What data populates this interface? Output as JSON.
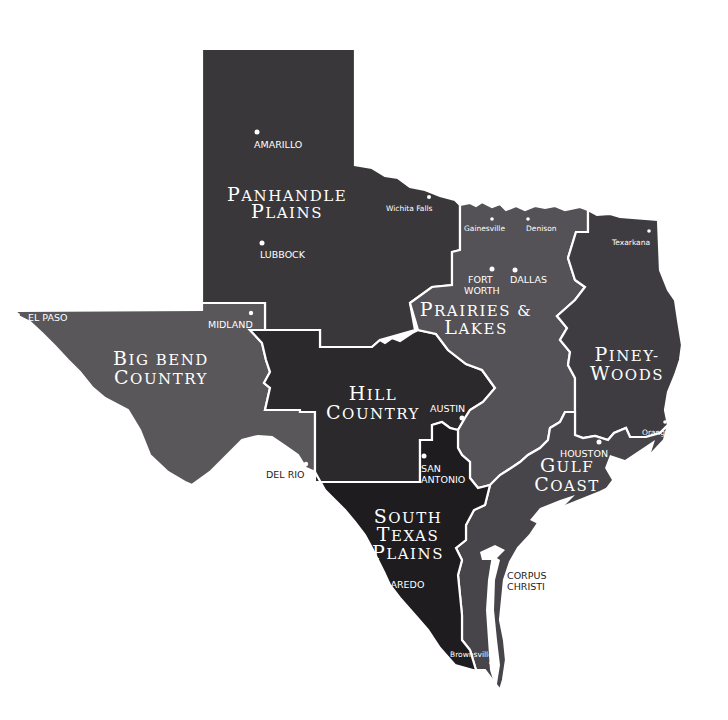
{
  "map": {
    "title": "Texas Regions",
    "colors": {
      "panhandle_plains": "#39373a",
      "big_bend_country": "#59575a",
      "hill_country": "#2b292c",
      "prairies_lakes": "#545256",
      "piney_woods": "#3e3c40",
      "gulf_coast": "#47454a",
      "south_texas_plains": "#1e1c1f",
      "border": "#ffffff",
      "background": "#ffffff"
    },
    "regions": [
      {
        "id": "panhandle_plains",
        "line1": "Panhandle",
        "line2": "Plains"
      },
      {
        "id": "big_bend_country",
        "line1": "Big Bend",
        "line2": "Country"
      },
      {
        "id": "hill_country",
        "line1": "Hill",
        "line2": "Country"
      },
      {
        "id": "prairies_lakes",
        "line1": "Prairies &",
        "line2": "Lakes"
      },
      {
        "id": "piney_woods",
        "line1": "Piney-",
        "line2": "woods"
      },
      {
        "id": "gulf_coast",
        "line1": "Gulf",
        "line2": "Coast"
      },
      {
        "id": "south_texas_plains",
        "line1": "South",
        "line2": "Texas",
        "line3": "Plains"
      }
    ],
    "cities": [
      {
        "name": "AMARILLO"
      },
      {
        "name": "LUBBOCK"
      },
      {
        "name": "Wichita Falls"
      },
      {
        "name": "Gainesville"
      },
      {
        "name": "Denison"
      },
      {
        "name": "Texarkana"
      },
      {
        "name": "FORT",
        "name2": "WORTH"
      },
      {
        "name": "DALLAS"
      },
      {
        "name": "EL PASO"
      },
      {
        "name": "MIDLAND"
      },
      {
        "name": "AUSTIN"
      },
      {
        "name": "Orange"
      },
      {
        "name": "HOUSTON"
      },
      {
        "name": "SAN",
        "name2": "ANTONIO"
      },
      {
        "name": "DEL RIO"
      },
      {
        "name": "LAREDO"
      },
      {
        "name": "CORPUS",
        "name2": "CHRISTI"
      },
      {
        "name": "Brownsville"
      }
    ]
  }
}
